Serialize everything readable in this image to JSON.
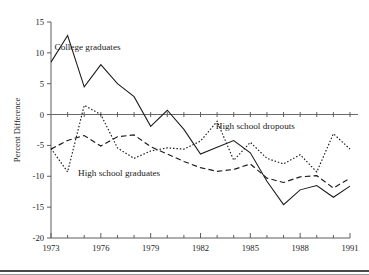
{
  "figure": {
    "title": "",
    "ylabel": "Percent Difference",
    "series_labels": {
      "college": "College graduates",
      "dropouts": "High school dropouts",
      "graduates": "High school graduates"
    }
  },
  "chart_data": {
    "type": "line",
    "title": "",
    "xlabel": "",
    "ylabel": "Percent Difference",
    "xlim": [
      1973,
      1991
    ],
    "ylim": [
      -20,
      15
    ],
    "yticks": [
      -20,
      -15,
      -10,
      -5,
      0,
      5,
      10,
      15
    ],
    "ytick_labels": [
      "-20",
      "-15",
      "-10",
      "-5",
      "0",
      "5",
      "10",
      "15"
    ],
    "xticks": [
      1973,
      1976,
      1979,
      1982,
      1985,
      1988,
      1991
    ],
    "xtick_labels": [
      "1973",
      "1976",
      "1979",
      "1982",
      "1985",
      "1988",
      "1991"
    ],
    "minor_xticks_every": 1,
    "grid": false,
    "legend": "inline-annotations",
    "zero_reference_line": 0,
    "x": [
      1973,
      1974,
      1975,
      1976,
      1977,
      1978,
      1979,
      1980,
      1981,
      1982,
      1983,
      1984,
      1985,
      1986,
      1987,
      1988,
      1989,
      1990,
      1991
    ],
    "series": [
      {
        "name": "College graduates",
        "style": "solid",
        "label_position": {
          "x": 1975.2,
          "y": 10.4
        },
        "values": [
          8.5,
          12.8,
          4.5,
          8.1,
          5.0,
          2.9,
          -1.9,
          0.7,
          -2.4,
          -6.4,
          -5.3,
          -4.2,
          -6.2,
          -10.8,
          -14.6,
          -12.2,
          -11.5,
          -13.4,
          -11.6
        ]
      },
      {
        "name": "High school graduates",
        "style": "dashed",
        "label_position": {
          "x": 1977.1,
          "y": -9.9
        },
        "values": [
          -5.6,
          -4.2,
          -3.4,
          -5.1,
          -3.6,
          -3.3,
          -5.2,
          -6.4,
          -7.6,
          -8.6,
          -9.2,
          -8.9,
          -8.0,
          -10.3,
          -11.0,
          -10.1,
          -9.9,
          -11.9,
          -10.3
        ]
      },
      {
        "name": "High school dropouts",
        "style": "dotted",
        "label_position": {
          "x": 1985.3,
          "y": -2.4
        },
        "values": [
          -5.5,
          -9.3,
          1.5,
          0.0,
          -5.4,
          -7.1,
          -5.9,
          -5.4,
          -5.6,
          -4.3,
          -1.1,
          -7.4,
          -4.5,
          -7.1,
          -8.0,
          -6.5,
          -9.3,
          -3.1,
          -5.6
        ]
      }
    ]
  }
}
